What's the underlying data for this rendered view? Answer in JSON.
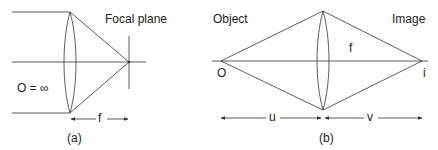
{
  "figure_a": {
    "caption": "(a)",
    "focal_plane_label": "Focal plane",
    "object_label": "O = ∞",
    "focal_length_label": "f"
  },
  "figure_b": {
    "caption": "(b)",
    "object_label": "Object",
    "image_label": "Image",
    "focal_length_label": "f",
    "object_point_label": "O",
    "image_point_label": "i",
    "object_distance_label": "u",
    "image_distance_label": "v"
  },
  "colors": {
    "line": "#333333",
    "text": "#222222"
  }
}
